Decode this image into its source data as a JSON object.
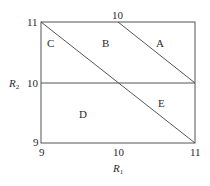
{
  "diagram": {
    "title": "",
    "x_axis": {
      "label": "R",
      "label_sub": "1",
      "ticks": [
        "9",
        "10",
        "11"
      ]
    },
    "y_axis": {
      "label": "R",
      "label_sub": "2",
      "ticks": [
        "9",
        "10",
        "11"
      ]
    },
    "top_tick": "10",
    "regions": [
      {
        "id": "A",
        "label": "A"
      },
      {
        "id": "B",
        "label": "B"
      },
      {
        "id": "C",
        "label": "C"
      },
      {
        "id": "D",
        "label": "D"
      },
      {
        "id": "E",
        "label": "E"
      }
    ],
    "lines": [
      {
        "name": "border",
        "from": [
          9,
          9
        ],
        "to": [
          11,
          11
        ],
        "type": "rect"
      },
      {
        "name": "horizontal-r2-10",
        "from": [
          9,
          10
        ],
        "to": [
          11,
          10
        ]
      },
      {
        "name": "diagonal-main",
        "from": [
          9,
          11
        ],
        "to": [
          11,
          9
        ]
      },
      {
        "name": "diagonal-upper",
        "from": [
          10,
          11
        ],
        "to": [
          11,
          10
        ]
      }
    ],
    "line_color": "#555555",
    "text_color": "#2a2a2a"
  }
}
